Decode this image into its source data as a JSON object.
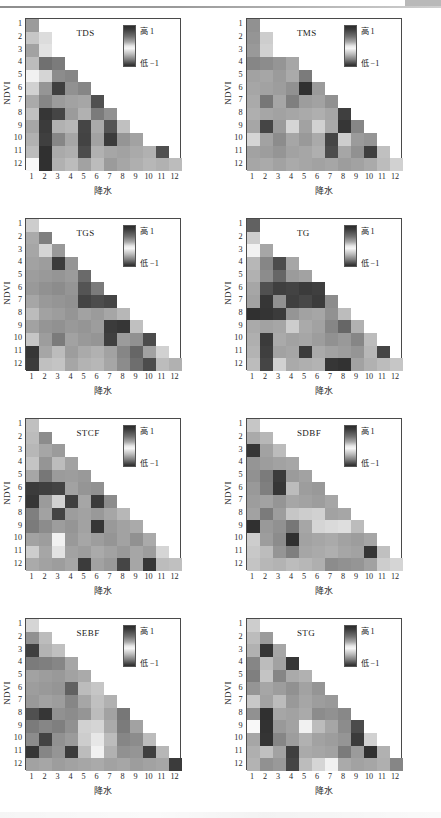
{
  "figure": {
    "type": "multi-panel-heatmap-grid",
    "panel_count": 8,
    "columns": 2,
    "rows": 4,
    "axis_x_label": "降水",
    "axis_y_label": "NDVI",
    "x_ticks": [
      "1",
      "2",
      "3",
      "4",
      "5",
      "6",
      "7",
      "8",
      "9",
      "10",
      "11",
      "12"
    ],
    "y_ticks": [
      "1",
      "2",
      "3",
      "4",
      "5",
      "6",
      "7",
      "8",
      "9",
      "10",
      "11",
      "12"
    ],
    "legend_high_label": "高 1",
    "legend_low_label": "低 −1",
    "colormap": "grayscale-diverging",
    "colors": {
      "frame": "#4a4a4a",
      "text": "#1a1a1a",
      "background": "#ffffff"
    }
  },
  "chart_data": {
    "type": "heatmap",
    "title": "",
    "xlabel": "降水",
    "ylabel": "NDVI",
    "x": [
      "1",
      "2",
      "3",
      "4",
      "5",
      "6",
      "7",
      "8",
      "9",
      "10",
      "11",
      "12"
    ],
    "y": [
      "1",
      "2",
      "3",
      "4",
      "5",
      "6",
      "7",
      "8",
      "9",
      "10",
      "11",
      "12"
    ],
    "zlim": [
      -1,
      1
    ],
    "grid": false,
    "legend_position": "inside-top-right",
    "note": "Lower-triangular matrices: cell (row i, col j) exists only where j <= i. Values are correlation-like in [-1,1]; grayscale where 0 = white, +-1 = dark.",
    "panels": [
      {
        "name": "TDS",
        "values": [
          [
            0.45
          ],
          [
            0.25,
            0.15
          ],
          [
            0.42,
            0.12
          ],
          [
            0.3,
            0.65,
            0.6
          ],
          [
            -0.05,
            0.18,
            0.52,
            0.55
          ],
          [
            0.2,
            0.48,
            0.88,
            0.5,
            0.55
          ],
          [
            0.38,
            0.55,
            0.45,
            0.42,
            0.4,
            0.8
          ],
          [
            0.28,
            0.92,
            0.85,
            0.45,
            0.35,
            0.6,
            0.5
          ],
          [
            0.4,
            0.9,
            0.35,
            0.32,
            0.85,
            0.38,
            0.78,
            0.28
          ],
          [
            0.35,
            0.88,
            0.55,
            0.4,
            0.86,
            0.42,
            0.9,
            0.48,
            0.42
          ],
          [
            0.3,
            0.95,
            0.38,
            0.36,
            0.82,
            0.35,
            0.4,
            0.42,
            0.38,
            0.35,
            0.8
          ],
          [
            -0.02,
            0.95,
            0.35,
            0.3,
            0.42,
            0.3,
            0.45,
            0.4,
            0.36,
            0.32,
            0.35,
            0.3
          ]
        ]
      },
      {
        "name": "TMS",
        "values": [
          [
            0.5
          ],
          [
            0.48,
            0.22
          ],
          [
            0.46,
            0.2
          ],
          [
            0.55,
            0.52,
            0.48,
            0.4
          ],
          [
            0.42,
            0.4,
            0.45,
            0.38,
            0.6
          ],
          [
            0.4,
            0.42,
            0.44,
            0.5,
            0.95,
            0.45
          ],
          [
            0.38,
            0.62,
            0.4,
            0.58,
            0.44,
            0.42,
            0.5
          ],
          [
            0.36,
            0.4,
            0.42,
            0.4,
            0.38,
            0.36,
            0.4,
            0.88
          ],
          [
            0.4,
            0.85,
            0.45,
            0.18,
            0.42,
            0.2,
            0.38,
            0.92,
            0.55
          ],
          [
            0.18,
            0.42,
            0.52,
            0.4,
            0.46,
            0.38,
            0.85,
            0.22,
            0.45,
            0.48
          ],
          [
            0.42,
            0.44,
            0.48,
            0.42,
            0.4,
            0.36,
            0.82,
            0.4,
            0.5,
            0.88,
            0.28
          ],
          [
            0.4,
            0.38,
            0.42,
            0.38,
            0.4,
            0.42,
            0.4,
            0.44,
            0.42,
            0.38,
            0.3,
            0.2
          ]
        ]
      },
      {
        "name": "TGS",
        "values": [
          [
            0.22
          ],
          [
            0.38,
            0.58
          ],
          [
            0.4,
            0.18,
            0.46
          ],
          [
            0.42,
            0.44,
            0.9,
            0.48
          ],
          [
            0.44,
            0.46,
            0.48,
            0.45,
            0.68
          ],
          [
            0.46,
            0.5,
            0.52,
            0.48,
            0.78,
            0.6
          ],
          [
            0.4,
            0.46,
            0.48,
            0.5,
            0.86,
            0.82,
            0.85
          ],
          [
            0.3,
            0.42,
            0.44,
            0.48,
            0.42,
            0.45,
            0.4,
            0.32
          ],
          [
            0.42,
            0.48,
            0.5,
            0.46,
            0.48,
            0.44,
            0.9,
            0.92,
            0.28
          ],
          [
            0.25,
            0.44,
            0.6,
            0.42,
            0.46,
            0.48,
            0.88,
            0.45,
            0.5,
            0.82
          ],
          [
            0.92,
            0.4,
            0.3,
            0.44,
            0.38,
            0.35,
            0.42,
            0.55,
            0.7,
            0.42,
            0.2
          ],
          [
            0.9,
            0.28,
            0.26,
            0.4,
            0.34,
            0.32,
            0.4,
            0.52,
            0.66,
            0.82,
            0.3,
            0.35
          ]
        ]
      },
      {
        "name": "TG",
        "values": [
          [
            0.72
          ],
          [
            0.22
          ],
          [
            -0.05,
            0.4
          ],
          [
            0.32,
            0.55,
            0.82,
            0.4
          ],
          [
            0.35,
            0.52,
            0.7,
            0.45,
            0.42
          ],
          [
            0.4,
            0.8,
            0.88,
            0.86,
            0.9,
            0.88
          ],
          [
            0.42,
            0.92,
            0.5,
            0.88,
            0.84,
            0.9,
            0.52
          ],
          [
            0.95,
            0.93,
            0.9,
            0.48,
            0.42,
            0.4,
            0.5,
            0.3
          ],
          [
            0.38,
            0.42,
            0.4,
            0.22,
            0.38,
            0.42,
            0.55,
            0.7,
            0.35
          ],
          [
            0.36,
            0.9,
            0.38,
            0.42,
            0.4,
            0.44,
            0.5,
            0.46,
            0.55,
            0.3
          ],
          [
            0.34,
            0.88,
            0.42,
            0.4,
            0.9,
            0.38,
            0.42,
            0.44,
            0.48,
            0.32,
            0.85
          ],
          [
            0.3,
            0.85,
            0.2,
            0.38,
            0.36,
            0.34,
            0.92,
            0.94,
            0.42,
            0.35,
            0.3,
            0.25
          ]
        ]
      },
      {
        "name": "STCF",
        "values": [
          [
            0.28
          ],
          [
            0.3,
            0.52
          ],
          [
            0.32,
            0.4,
            0.45
          ],
          [
            0.26,
            0.48,
            0.3,
            0.42
          ],
          [
            0.4,
            0.62,
            0.45,
            0.44,
            0.46
          ],
          [
            0.9,
            0.88,
            0.86,
            0.42,
            0.48,
            0.5
          ],
          [
            0.92,
            0.45,
            0.2,
            0.88,
            0.4,
            0.9,
            0.52
          ],
          [
            0.58,
            0.42,
            0.86,
            0.44,
            0.42,
            0.46,
            0.4,
            0.32
          ],
          [
            0.6,
            0.52,
            0.44,
            0.48,
            0.42,
            0.92,
            0.46,
            0.42,
            0.38
          ],
          [
            0.42,
            0.44,
            0.05,
            0.46,
            0.4,
            0.44,
            0.48,
            0.42,
            0.5,
            0.38
          ],
          [
            0.22,
            0.4,
            0.12,
            0.42,
            0.44,
            0.38,
            0.42,
            0.46,
            0.4,
            0.44,
            0.18
          ],
          [
            0.38,
            0.42,
            0.44,
            0.4,
            0.9,
            0.42,
            0.46,
            0.85,
            0.4,
            0.92,
            0.3,
            0.28
          ]
        ]
      },
      {
        "name": "SDBF",
        "values": [
          [
            0.25
          ],
          [
            0.38,
            0.32
          ],
          [
            0.92,
            0.42,
            0.3
          ],
          [
            0.48,
            0.44,
            0.42,
            0.4
          ],
          [
            0.5,
            0.6,
            0.9,
            0.45,
            0.42
          ],
          [
            0.46,
            0.58,
            0.92,
            0.3,
            0.44,
            0.46
          ],
          [
            0.44,
            0.42,
            0.48,
            0.4,
            0.42,
            0.44,
            0.4
          ],
          [
            0.42,
            0.6,
            0.44,
            0.25,
            0.22,
            0.2,
            0.42,
            0.4
          ],
          [
            0.95,
            0.46,
            0.5,
            0.62,
            0.4,
            0.18,
            0.16,
            0.14,
            0.3
          ],
          [
            0.22,
            0.44,
            0.52,
            0.95,
            0.42,
            0.4,
            0.38,
            0.42,
            0.44,
            0.4
          ],
          [
            0.24,
            0.3,
            0.48,
            0.58,
            0.4,
            0.38,
            0.36,
            0.4,
            0.42,
            0.92,
            0.28
          ],
          [
            0.26,
            0.32,
            0.34,
            0.3,
            0.32,
            0.36,
            0.52,
            0.5,
            0.48,
            0.42,
            0.22,
            0.18
          ]
        ]
      },
      {
        "name": "SEBF",
        "values": [
          [
            0.18
          ],
          [
            0.5,
            0.3
          ],
          [
            0.88,
            0.34,
            0.28
          ],
          [
            0.6,
            0.58,
            0.55,
            0.4
          ],
          [
            0.42,
            0.44,
            0.46,
            0.42,
            0.38
          ],
          [
            0.44,
            0.46,
            0.48,
            0.72,
            0.3,
            0.25
          ],
          [
            0.46,
            0.42,
            0.44,
            0.55,
            0.4,
            0.28,
            0.35
          ],
          [
            0.8,
            0.92,
            0.5,
            0.52,
            0.48,
            0.3,
            0.42,
            0.62
          ],
          [
            0.6,
            0.55,
            0.58,
            0.5,
            0.2,
            0.18,
            0.38,
            0.6,
            0.42
          ],
          [
            0.52,
            0.86,
            0.5,
            0.45,
            0.22,
            0.1,
            0.3,
            0.55,
            0.52,
            0.3
          ],
          [
            0.92,
            0.55,
            0.48,
            0.9,
            0.3,
            0.05,
            0.35,
            0.5,
            0.48,
            0.88,
            0.32
          ],
          [
            0.42,
            0.4,
            0.44,
            0.42,
            0.4,
            0.38,
            0.42,
            0.4,
            0.44,
            0.42,
            0.4,
            0.9
          ]
        ]
      },
      {
        "name": "STG",
        "values": [
          [
            0.22
          ],
          [
            0.3,
            0.45
          ],
          [
            0.35,
            0.92,
            0.4
          ],
          [
            0.55,
            0.3,
            0.42,
            0.92
          ],
          [
            0.58,
            0.26,
            0.55,
            0.38,
            0.35
          ],
          [
            0.48,
            0.4,
            0.44,
            0.5,
            0.42,
            0.48
          ],
          [
            0.24,
            0.42,
            0.3,
            0.46,
            0.4,
            0.44,
            0.46
          ],
          [
            0.5,
            0.95,
            0.4,
            0.42,
            0.38,
            0.52,
            0.5,
            0.54
          ],
          [
            0.02,
            0.94,
            0.46,
            0.42,
            0.05,
            0.3,
            0.4,
            0.52,
            0.82
          ],
          [
            0.4,
            0.93,
            0.55,
            0.44,
            0.35,
            0.42,
            0.44,
            0.48,
            0.9,
            0.2
          ],
          [
            0.36,
            0.28,
            0.42,
            0.88,
            0.38,
            0.4,
            0.42,
            0.6,
            0.45,
            0.95,
            0.35
          ],
          [
            0.34,
            0.5,
            0.46,
            0.85,
            0.3,
            0.18,
            0.05,
            0.38,
            0.42,
            0.4,
            0.36,
            0.55
          ]
        ]
      }
    ]
  }
}
